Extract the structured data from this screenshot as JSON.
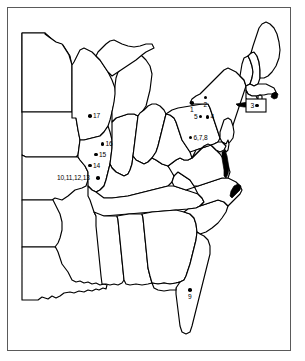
{
  "figure": {
    "name": "eastern-united-states-site-map",
    "frame": {
      "border_color": "#5a5a5a",
      "background": "#ffffff"
    },
    "map_outline_color": "#000000",
    "marker_color": "#000000"
  },
  "markers": [
    {
      "id": "1",
      "label": "1",
      "x": 192.0,
      "y": 103.0,
      "label_pos": "lbl-below"
    },
    {
      "id": "2",
      "label": "2",
      "x": 205.5,
      "y": 97.5,
      "label_pos": "lbl-below"
    },
    {
      "id": "3",
      "label": "3",
      "x": 257.0,
      "y": 105.5,
      "label_pos": "lbl-left"
    },
    {
      "id": "4",
      "label": "4",
      "x": 207.5,
      "y": 117.0,
      "label_pos": "lbl-right"
    },
    {
      "id": "5",
      "label": "5",
      "x": 200.5,
      "y": 116.5,
      "label_pos": "lbl-left"
    },
    {
      "id": "6,7,8",
      "label": "6,7,8",
      "x": 190.5,
      "y": 137.5,
      "label_pos": "lbl-right"
    },
    {
      "id": "9",
      "label": "9",
      "x": 190.0,
      "y": 290.0,
      "label_pos": "lbl-below"
    },
    {
      "id": "10,11,12,13",
      "label": "10,11,12,13",
      "x": 98.0,
      "y": 178.0,
      "label_pos": "lbl-farleft"
    },
    {
      "id": "14",
      "label": "14",
      "x": 90.0,
      "y": 165.5,
      "label_pos": "lbl-right"
    },
    {
      "id": "15",
      "label": "15",
      "x": 96.0,
      "y": 154.5,
      "label_pos": "lbl-right"
    },
    {
      "id": "16",
      "label": "16",
      "x": 102.5,
      "y": 144.0,
      "label_pos": "lbl-right"
    },
    {
      "id": "17",
      "label": "17",
      "x": 90.0,
      "y": 116.0,
      "label_pos": "lbl-right"
    }
  ]
}
